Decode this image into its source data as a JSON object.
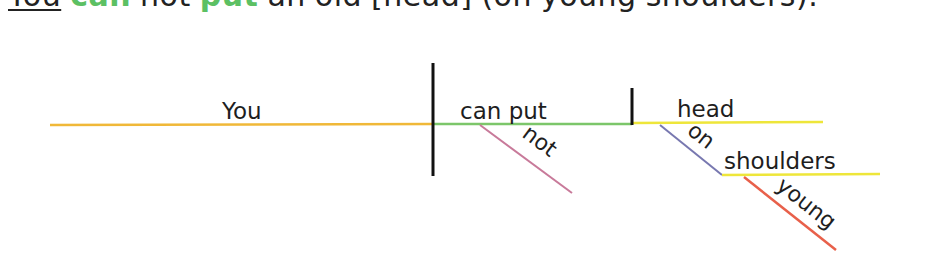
{
  "sentence": {
    "words": [
      {
        "text": "You",
        "role": "subject"
      },
      {
        "text": "can",
        "role": "verb"
      },
      {
        "text": "not",
        "role": "plain"
      },
      {
        "text": "put",
        "role": "verb"
      },
      {
        "text": "an",
        "role": "plain"
      },
      {
        "text": "old",
        "role": "plain"
      },
      {
        "text": "[head]",
        "role": "plain"
      },
      {
        "text": "(on",
        "role": "plain"
      },
      {
        "text": "young",
        "role": "plain"
      },
      {
        "text": "shoulders).",
        "role": "plain"
      }
    ],
    "verb_color": "#5cc063"
  },
  "diagram": {
    "subject": {
      "label": "You",
      "line_color": "#f0b838"
    },
    "predicate": {
      "label": "can put",
      "line_color": "#7cc66a"
    },
    "object": {
      "label": "head",
      "line_color": "#eee63a"
    },
    "modifiers": [
      {
        "label": "not",
        "attaches_to": "can put",
        "line_color": "#c87a9a"
      },
      {
        "label": "on",
        "attaches_to": "head",
        "line_color": "#7878b0"
      },
      {
        "label": "young",
        "attaches_to": "shoulders",
        "line_color": "#e8604a"
      }
    ],
    "prep_object": {
      "label": "shoulders",
      "line_color": "#eee63a"
    },
    "divider_color": "#111111"
  }
}
